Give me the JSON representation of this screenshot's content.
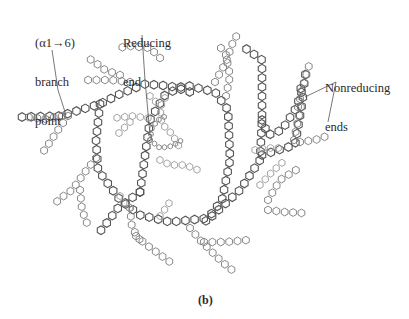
{
  "figure": {
    "caption": "(b)",
    "labels": {
      "branch_point": {
        "line1": "(α1→6)",
        "line2": "branch",
        "line3": "point"
      },
      "reducing_end": {
        "line1": "Reducing",
        "line2": "end"
      },
      "nonreducing_ends": {
        "line1": "Nonreducing",
        "line2": "ends"
      }
    },
    "colors": {
      "dark": "#555555",
      "mid": "#7a7a7a",
      "light": "#9a9a9a",
      "leader": "#555555",
      "text": "#2a2a2a"
    },
    "hex_size": {
      "dark": 4.3,
      "mid": 3.9,
      "light": 3.6,
      "tiny": 2.6
    },
    "chains": [
      {
        "tone": "dark",
        "points": [
          [
            140,
            192
          ],
          [
            118,
            208
          ],
          [
            106,
            224
          ],
          [
            98,
            234
          ]
        ]
      },
      {
        "tone": "dark",
        "points": [
          [
            140,
            192
          ],
          [
            150,
            120
          ],
          [
            165,
            95
          ],
          [
            185,
            85
          ],
          [
            215,
            92
          ],
          [
            228,
            110
          ],
          [
            230,
            160
          ],
          [
            222,
            200
          ],
          [
            205,
            222
          ]
        ]
      },
      {
        "tone": "dark",
        "points": [
          [
            22,
            117
          ],
          [
            60,
            116
          ],
          [
            100,
            104
          ],
          [
            120,
            94
          ],
          [
            145,
            84
          ],
          [
            170,
            86
          ],
          [
            190,
            92
          ]
        ]
      },
      {
        "tone": "dark",
        "points": [
          [
            100,
            104
          ],
          [
            96,
            140
          ],
          [
            98,
            170
          ],
          [
            120,
            200
          ],
          [
            140,
            215
          ],
          [
            170,
            222
          ],
          [
            210,
            218
          ],
          [
            240,
            190
          ],
          [
            260,
            160
          ],
          [
            262,
            120
          ],
          [
            262,
            60
          ],
          [
            245,
            48
          ]
        ]
      },
      {
        "tone": "dark",
        "points": [
          [
            262,
            120
          ],
          [
            268,
            135
          ],
          [
            282,
            130
          ],
          [
            296,
            108
          ],
          [
            304,
            85
          ],
          [
            306,
            70
          ]
        ]
      },
      {
        "tone": "dark",
        "points": [
          [
            262,
            155
          ],
          [
            295,
            145
          ],
          [
            303,
            98
          ],
          [
            300,
            85
          ]
        ]
      },
      {
        "tone": "mid",
        "points": [
          [
            62,
            116
          ],
          [
            45,
            119
          ],
          [
            28,
            117
          ]
        ]
      },
      {
        "tone": "mid",
        "points": [
          [
            68,
            116
          ],
          [
            58,
            130
          ],
          [
            48,
            145
          ],
          [
            43,
            152
          ]
        ]
      },
      {
        "tone": "mid",
        "points": [
          [
            96,
            158
          ],
          [
            85,
            172
          ],
          [
            72,
            190
          ],
          [
            58,
            200
          ],
          [
            55,
            205
          ]
        ]
      },
      {
        "tone": "mid",
        "points": [
          [
            80,
            190
          ],
          [
            82,
            210
          ],
          [
            88,
            226
          ]
        ]
      },
      {
        "tone": "mid",
        "points": [
          [
            130,
            208
          ],
          [
            132,
            228
          ],
          [
            140,
            240
          ]
        ]
      },
      {
        "tone": "mid",
        "points": [
          [
            136,
            236
          ],
          [
            148,
            246
          ],
          [
            170,
            262
          ]
        ]
      },
      {
        "tone": "mid",
        "points": [
          [
            190,
            228
          ],
          [
            200,
            240
          ],
          [
            222,
            262
          ],
          [
            232,
            270
          ]
        ]
      },
      {
        "tone": "mid",
        "points": [
          [
            204,
            242
          ],
          [
            226,
            242
          ],
          [
            248,
            240
          ]
        ]
      },
      {
        "tone": "mid",
        "points": [
          [
            268,
            200
          ],
          [
            280,
            180
          ],
          [
            296,
            170
          ]
        ]
      },
      {
        "tone": "mid",
        "points": [
          [
            268,
            210
          ],
          [
            284,
            212
          ],
          [
            302,
            213
          ]
        ]
      },
      {
        "tone": "mid",
        "points": [
          [
            215,
            82
          ],
          [
            226,
            62
          ],
          [
            233,
            42
          ],
          [
            240,
            30
          ]
        ]
      },
      {
        "tone": "mid",
        "points": [
          [
            226,
            96
          ],
          [
            230,
            76
          ],
          [
            226,
            55
          ],
          [
            218,
            44
          ]
        ]
      },
      {
        "tone": "mid",
        "points": [
          [
            298,
            107
          ],
          [
            304,
            83
          ],
          [
            310,
            62
          ]
        ]
      },
      {
        "tone": "mid",
        "points": [
          [
            294,
            140
          ],
          [
            298,
            120
          ],
          [
            302,
            102
          ]
        ]
      },
      {
        "tone": "mid",
        "points": [
          [
            300,
            142
          ],
          [
            315,
            140
          ],
          [
            327,
            136
          ],
          [
            328,
            132
          ]
        ]
      },
      {
        "tone": "mid",
        "points": [
          [
            120,
            75
          ],
          [
            105,
            70
          ],
          [
            92,
            60
          ],
          [
            86,
            58
          ]
        ]
      },
      {
        "tone": "mid",
        "points": [
          [
            130,
            82
          ],
          [
            110,
            80
          ],
          [
            95,
            80
          ],
          [
            85,
            80
          ]
        ]
      },
      {
        "tone": "mid",
        "points": [
          [
            160,
            58
          ],
          [
            150,
            48
          ],
          [
            130,
            46
          ],
          [
            118,
            48
          ]
        ]
      },
      {
        "tone": "light",
        "points": [
          [
            148,
            118
          ],
          [
            132,
            116
          ],
          [
            115,
            118
          ]
        ]
      },
      {
        "tone": "light",
        "points": [
          [
            130,
            122
          ],
          [
            122,
            130
          ],
          [
            114,
            138
          ]
        ]
      },
      {
        "tone": "light",
        "points": [
          [
            160,
            160
          ],
          [
            170,
            165
          ],
          [
            185,
            165
          ],
          [
            198,
            170
          ]
        ]
      },
      {
        "tone": "light",
        "points": [
          [
            165,
            98
          ],
          [
            160,
            108
          ],
          [
            162,
            124
          ],
          [
            172,
            134
          ],
          [
            180,
            148
          ]
        ]
      },
      {
        "tone": "light",
        "points": [
          [
            150,
            96
          ],
          [
            158,
            104
          ]
        ]
      },
      {
        "tone": "light",
        "points": [
          [
            120,
            196
          ],
          [
            125,
            205
          ],
          [
            135,
            211
          ]
        ]
      },
      {
        "tone": "light",
        "points": [
          [
            260,
            185
          ],
          [
            272,
            172
          ],
          [
            285,
            160
          ]
        ]
      },
      {
        "tone": "light",
        "points": [
          [
            255,
            150
          ],
          [
            268,
            148
          ],
          [
            280,
            148
          ]
        ]
      },
      {
        "tone": "light",
        "points": [
          [
            160,
            216
          ],
          [
            168,
            205
          ],
          [
            172,
            198
          ]
        ]
      },
      {
        "tone": "tiny",
        "points": [
          [
            150,
            140
          ],
          [
            160,
            148
          ],
          [
            172,
            146
          ],
          [
            182,
            140
          ]
        ]
      },
      {
        "tone": "tiny",
        "points": [
          [
            150,
            140
          ],
          [
            152,
            128
          ],
          [
            158,
            120
          ],
          [
            166,
            116
          ]
        ]
      }
    ],
    "leaders": [
      {
        "name": "branch-point-leader",
        "points": [
          [
            52,
            50
          ],
          [
            58,
            90
          ],
          [
            66,
            115
          ]
        ]
      },
      {
        "name": "reducing-end-leader",
        "points": [
          [
            142,
            35
          ],
          [
            145,
            80
          ],
          [
            150,
            135
          ]
        ]
      },
      {
        "name": "nonreducing-leader-a",
        "points": [
          [
            336,
            82
          ],
          [
            305,
            97
          ]
        ]
      },
      {
        "name": "nonreducing-leader-b",
        "points": [
          [
            336,
            82
          ],
          [
            328,
            122
          ]
        ]
      }
    ]
  }
}
